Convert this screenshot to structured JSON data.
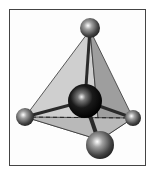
{
  "figure": {
    "colors": {
      "frame": "#444444",
      "face_left": "#c8c8c8",
      "face_right": "#9a9a9a",
      "face_bottom": "#b4b4b4",
      "bond": "#2a2a2a",
      "central_atom": "#111111",
      "outer_atom": "#555555"
    },
    "atoms": [
      {
        "id": "central",
        "cx": 85,
        "cy": 101,
        "r": 17
      },
      {
        "id": "top",
        "cx": 90,
        "cy": 28,
        "r": 10
      },
      {
        "id": "left",
        "cx": 25,
        "cy": 117,
        "r": 9
      },
      {
        "id": "right",
        "cx": 133,
        "cy": 118,
        "r": 8
      },
      {
        "id": "bottom",
        "cx": 100,
        "cy": 145,
        "r": 14
      }
    ]
  }
}
